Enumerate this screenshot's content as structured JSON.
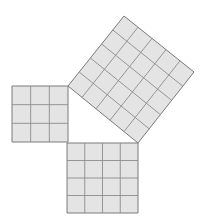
{
  "diagram": {
    "colors": {
      "fill": "#e4e4e4",
      "grid": "#8c8c8c",
      "outline": "#7a7a7a",
      "background": "#ffffff"
    },
    "squares": [
      {
        "name": "small-square",
        "grid": 3,
        "corners": [
          [
            12,
            86
          ],
          [
            68,
            86
          ],
          [
            68,
            142
          ],
          [
            12,
            142
          ]
        ]
      },
      {
        "name": "medium-square",
        "grid": 4,
        "corners": [
          [
            67,
            143
          ],
          [
            138,
            143
          ],
          [
            138,
            213
          ],
          [
            67,
            213
          ]
        ]
      },
      {
        "name": "large-square",
        "grid": 5,
        "corners": [
          [
            68,
            86
          ],
          [
            124,
            16
          ],
          [
            194,
            72
          ],
          [
            138,
            143
          ]
        ]
      }
    ],
    "triangle": {
      "vertices": [
        [
          68,
          86
        ],
        [
          68,
          143
        ],
        [
          138,
          143
        ]
      ],
      "legs": [
        3,
        4
      ],
      "hypotenuse": 5
    }
  }
}
